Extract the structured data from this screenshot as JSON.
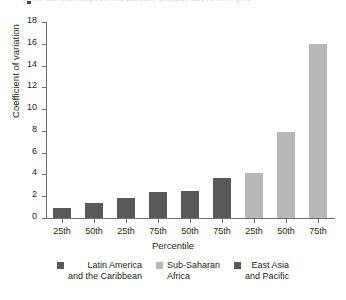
{
  "figure": {
    "top_artifact_text": "of the bar chart caption line partially cropped above the figure"
  },
  "chart_data": {
    "type": "bar",
    "title": "",
    "subtitle": "",
    "xlabel": "Percentile",
    "ylabel": "Coefficient of variation",
    "categories": [
      "25th",
      "50th",
      "25th",
      "75th",
      "50th",
      "75th",
      "25th",
      "50th",
      "75th"
    ],
    "values": [
      0.9,
      1.4,
      1.8,
      2.4,
      2.5,
      3.7,
      4.1,
      7.9,
      16.0
    ],
    "bar_series": [
      "Latin America and the Caribbean",
      "Latin America and the Caribbean",
      "East Asia and Pacific",
      "East Asia and Pacific",
      "East Asia and Pacific",
      "East Asia and Pacific",
      "Sub-Saharan Africa",
      "Sub-Saharan Africa",
      "Sub-Saharan Africa"
    ],
    "bar_colors": [
      "#595959",
      "#595959",
      "#595959",
      "#595959",
      "#595959",
      "#595959",
      "#b8b8b8",
      "#b8b8b8",
      "#b8b8b8"
    ],
    "ylim": [
      0,
      18
    ],
    "yticks": [
      0,
      2,
      4,
      6,
      8,
      10,
      12,
      14,
      16,
      18
    ],
    "ytick_labels": [
      "0",
      "2",
      "4",
      "6",
      "8",
      "10",
      "12",
      "14",
      "16",
      "18"
    ],
    "grid": false,
    "legend_position": "bottom",
    "legend": [
      {
        "label": "Latin America\nand the Caribbean",
        "color": "#595959",
        "align": "right"
      },
      {
        "label": "Sub-Saharan\nAfrica",
        "color": "#b8b8b8",
        "align": "left"
      },
      {
        "label": "East Asia\nand Pacific",
        "color": "#595959",
        "align": "right"
      }
    ]
  }
}
